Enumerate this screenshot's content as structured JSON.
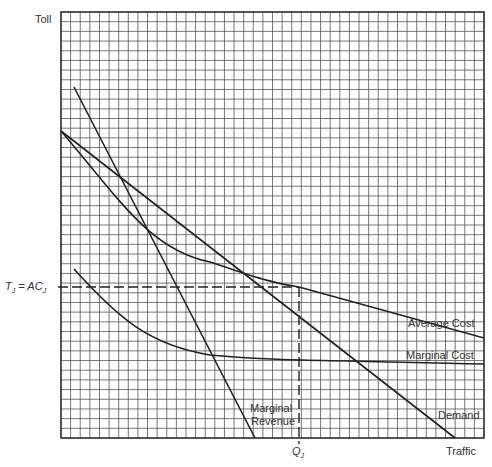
{
  "chart_data": {
    "type": "line",
    "title": "",
    "xlabel": "Traffic",
    "ylabel": "Toll",
    "grid": true,
    "grid_cells": [
      44,
      44
    ],
    "xlim": [
      0,
      44
    ],
    "ylim": [
      0,
      44
    ],
    "series": [
      {
        "name": "Demand",
        "points": [
          [
            0,
            32
          ],
          [
            40.5,
            0
          ]
        ]
      },
      {
        "name": "Marginal Revenue",
        "points": [
          [
            1.3,
            36.5
          ],
          [
            20.2,
            0
          ]
        ]
      },
      {
        "name": "Average Cost",
        "points": [
          [
            0,
            32
          ],
          [
            8,
            22
          ],
          [
            14,
            17
          ],
          [
            19,
            15
          ],
          [
            24.8,
            15.9
          ],
          [
            44,
            10.4
          ]
        ]
      },
      {
        "name": "Marginal Cost",
        "points": [
          [
            1.3,
            17.6
          ],
          [
            8,
            10.5
          ],
          [
            15,
            8.2
          ],
          [
            25,
            8
          ],
          [
            44,
            7.6
          ]
        ]
      }
    ],
    "annotations": {
      "equilibrium_toll_label": "T_J = AC_J",
      "equilibrium_traffic_label": "Q_J",
      "equilibrium_point": [
        24.8,
        15.9
      ]
    }
  },
  "labels": {
    "y_axis": "Toll",
    "x_axis": "Traffic",
    "average_cost": "Average Cost",
    "marginal_cost": "Marginal Cost",
    "marginal_revenue_line1": "Marginal",
    "marginal_revenue_line2": "Revenue",
    "demand": "Demand",
    "toll_eq_T": "T",
    "toll_eq_sub": "J",
    "toll_eq_mid": " = AC",
    "toll_eq_sub2": "J",
    "q_label": "Q",
    "q_sub": "J"
  }
}
